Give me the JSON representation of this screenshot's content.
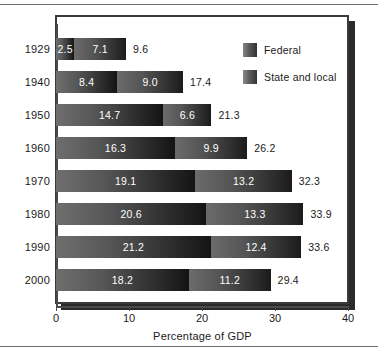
{
  "chart_data": {
    "type": "bar",
    "orientation": "horizontal",
    "stacked": true,
    "title": "",
    "xlabel": "Percentage of GDP",
    "ylabel": "",
    "xlim": [
      0,
      40
    ],
    "xticks": [
      "0",
      "10",
      "20",
      "30",
      "40"
    ],
    "grid": false,
    "legend_position": "top-right",
    "categories": [
      "1929",
      "1940",
      "1950",
      "1960",
      "1970",
      "1980",
      "1990",
      "2000"
    ],
    "series": [
      {
        "name": "Federal",
        "color": "#565656",
        "values": [
          2.5,
          8.4,
          14.7,
          16.3,
          19.1,
          20.6,
          21.2,
          18.2
        ],
        "labels": [
          "2.5",
          "8.4",
          "14.7",
          "16.3",
          "19.1",
          "20.6",
          "21.2",
          "18.2"
        ]
      },
      {
        "name": "State and local",
        "color": "#545454",
        "values": [
          7.1,
          9.0,
          6.6,
          9.9,
          13.2,
          13.3,
          12.4,
          11.2
        ],
        "labels": [
          "7.1",
          "9.0",
          "6.6",
          "9.9",
          "13.2",
          "13.3",
          "12.4",
          "11.2"
        ]
      }
    ],
    "totals": [
      9.6,
      17.4,
      21.3,
      26.2,
      32.3,
      33.9,
      33.6,
      29.4
    ],
    "total_labels": [
      "9.6",
      "17.4",
      "21.3",
      "26.2",
      "32.3",
      "33.9",
      "33.6",
      "29.4"
    ]
  },
  "legend": {
    "items": [
      {
        "label": "Federal",
        "swatch": "federal-swatch-icon"
      },
      {
        "label": "State and local",
        "swatch": "state-and-local-swatch-icon"
      }
    ]
  },
  "axis": {
    "x_title": "Percentage of GDP",
    "x_tick_labels": [
      "0",
      "10",
      "20",
      "30",
      "40"
    ],
    "y_tick_labels": [
      "1929",
      "1940",
      "1950",
      "1960",
      "1970",
      "1980",
      "1990",
      "2000"
    ]
  }
}
